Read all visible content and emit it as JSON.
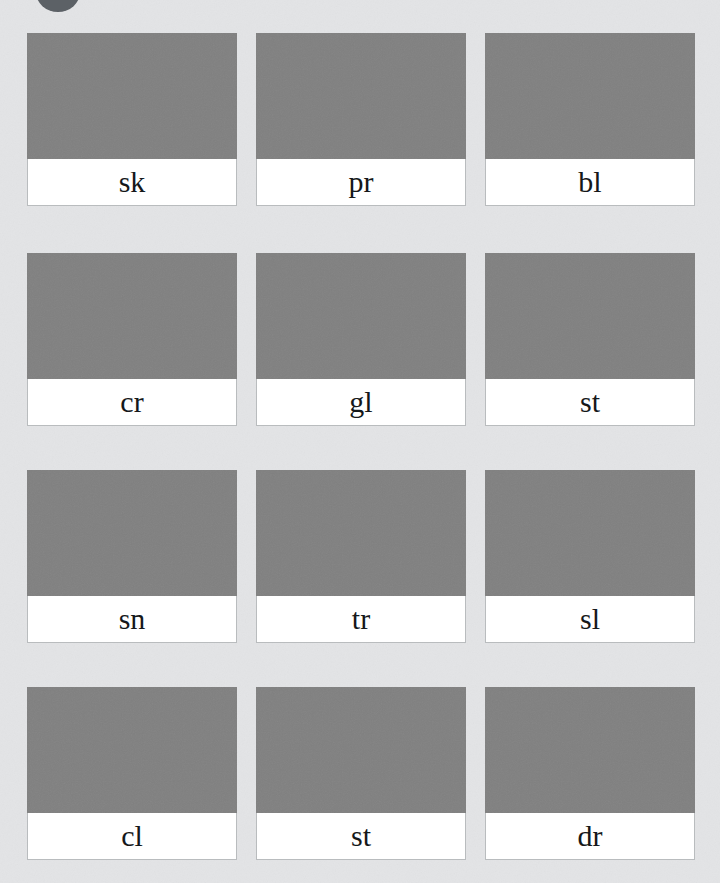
{
  "page": {
    "background_color": "#e3e4e6",
    "image_placeholder_color": "#808080",
    "label_background_color": "#ffffff",
    "label_text_color": "#15181a",
    "card_border_color": "#b9bcbe"
  },
  "top_element": {
    "icon": "circle-avatar-partial",
    "color": "#5c6166"
  },
  "grid": {
    "columns": 3,
    "rows": 4,
    "cards": [
      {
        "label": "sk",
        "image": "image-placeholder"
      },
      {
        "label": "pr",
        "image": "image-placeholder"
      },
      {
        "label": "bl",
        "image": "image-placeholder"
      },
      {
        "label": "cr",
        "image": "image-placeholder"
      },
      {
        "label": "gl",
        "image": "image-placeholder"
      },
      {
        "label": "st",
        "image": "image-placeholder"
      },
      {
        "label": "sn",
        "image": "image-placeholder"
      },
      {
        "label": "tr",
        "image": "image-placeholder"
      },
      {
        "label": "sl",
        "image": "image-placeholder"
      },
      {
        "label": "cl",
        "image": "image-placeholder"
      },
      {
        "label": "st",
        "image": "image-placeholder"
      },
      {
        "label": "dr",
        "image": "image-placeholder"
      }
    ]
  }
}
